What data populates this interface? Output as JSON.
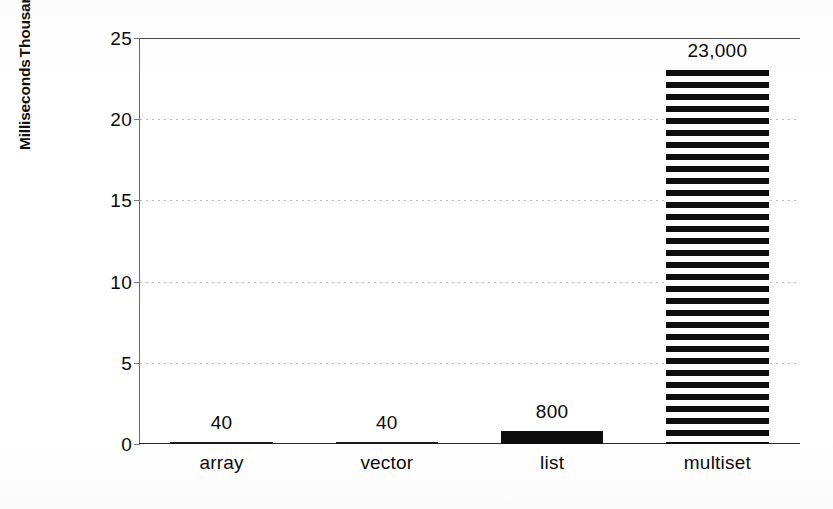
{
  "chart_data": {
    "type": "bar",
    "title": "",
    "subtitle": "",
    "xlabel": "",
    "ylabel_lines": [
      "Milliseconds",
      "Thousands"
    ],
    "ylabel": "Milliseconds Thousands",
    "categories": [
      "array",
      "vector",
      "list",
      "multiset"
    ],
    "values": [
      0.04,
      0.04,
      0.8,
      23
    ],
    "value_labels": [
      "40",
      "40",
      "800",
      "23,000"
    ],
    "value_units": "Milliseconds",
    "values_raw_ms": [
      40,
      40,
      800,
      23000
    ],
    "ylim": [
      0,
      25
    ],
    "y_ticks": [
      0,
      5,
      10,
      15,
      20,
      25
    ],
    "y_tick_labels": [
      "0",
      "5",
      "10",
      "15",
      "20",
      "25"
    ],
    "grid": true,
    "grid_style": "dotted-horizontal",
    "legend": false,
    "legend_position": "none",
    "bar_fill": [
      "solid",
      "solid",
      "solid",
      "horizontal-stripes"
    ],
    "colors": {
      "ink": "#0d0d0d",
      "background": "#ffffff",
      "gridline": "#bdbdbd",
      "axis": "#2a2a2a"
    }
  }
}
